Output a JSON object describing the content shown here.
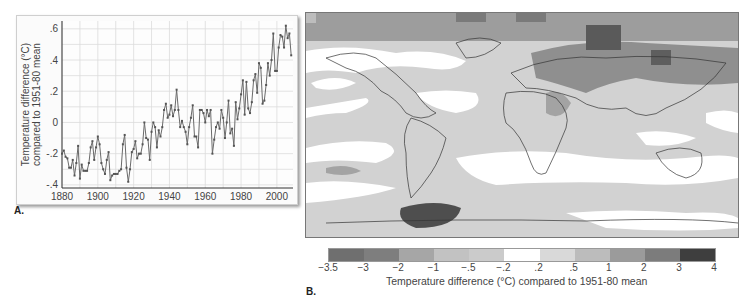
{
  "panels": {
    "a": {
      "letter": "A."
    },
    "b": {
      "letter": "B."
    }
  },
  "chart_data": [
    {
      "type": "line",
      "title": "",
      "xlabel": "",
      "ylabel": "Temperature difference (°C) compared to 1951-80 mean",
      "ylabel_lines": [
        "Temperature difference (°C)",
        "compared to 1951-80 mean"
      ],
      "xlim": [
        1880,
        2009
      ],
      "ylim": [
        -0.4,
        0.65
      ],
      "x_ticks": [
        "1880",
        "1900",
        "1920",
        "1940",
        "1960",
        "1980",
        "2000"
      ],
      "y_ticks": [
        ".6",
        ".4",
        ".2",
        "0",
        "-.2",
        "-.4"
      ],
      "grid": true,
      "marker": "square",
      "series": [
        {
          "name": "Global temperature anomaly",
          "x": [
            1880,
            1881,
            1882,
            1883,
            1884,
            1885,
            1886,
            1887,
            1888,
            1889,
            1890,
            1891,
            1892,
            1893,
            1894,
            1895,
            1896,
            1897,
            1898,
            1899,
            1900,
            1901,
            1902,
            1903,
            1904,
            1905,
            1906,
            1907,
            1908,
            1909,
            1910,
            1911,
            1912,
            1913,
            1914,
            1915,
            1916,
            1917,
            1918,
            1919,
            1920,
            1921,
            1922,
            1923,
            1924,
            1925,
            1926,
            1927,
            1928,
            1929,
            1930,
            1931,
            1932,
            1933,
            1934,
            1935,
            1936,
            1937,
            1938,
            1939,
            1940,
            1941,
            1942,
            1943,
            1944,
            1945,
            1946,
            1947,
            1948,
            1949,
            1950,
            1951,
            1952,
            1953,
            1954,
            1955,
            1956,
            1957,
            1958,
            1959,
            1960,
            1961,
            1962,
            1963,
            1964,
            1965,
            1966,
            1967,
            1968,
            1969,
            1970,
            1971,
            1972,
            1973,
            1974,
            1975,
            1976,
            1977,
            1978,
            1979,
            1980,
            1981,
            1982,
            1983,
            1984,
            1985,
            1986,
            1987,
            1988,
            1989,
            1990,
            1991,
            1992,
            1993,
            1994,
            1995,
            1996,
            1997,
            1998,
            1999,
            2000,
            2001,
            2002,
            2003,
            2004,
            2005,
            2006,
            2007,
            2008
          ],
          "values": [
            -0.2,
            -0.18,
            -0.22,
            -0.23,
            -0.29,
            -0.29,
            -0.24,
            -0.34,
            -0.26,
            -0.15,
            -0.36,
            -0.27,
            -0.31,
            -0.31,
            -0.31,
            -0.26,
            -0.16,
            -0.12,
            -0.24,
            -0.16,
            -0.09,
            -0.14,
            -0.26,
            -0.3,
            -0.33,
            -0.24,
            -0.19,
            -0.37,
            -0.34,
            -0.33,
            -0.33,
            -0.33,
            -0.31,
            -0.3,
            -0.14,
            -0.08,
            -0.29,
            -0.38,
            -0.3,
            -0.19,
            -0.17,
            -0.12,
            -0.23,
            -0.2,
            -0.2,
            -0.14,
            -0.0,
            -0.1,
            -0.11,
            -0.24,
            -0.06,
            -0.0,
            -0.03,
            -0.16,
            -0.05,
            -0.09,
            -0.03,
            0.08,
            0.12,
            0.03,
            0.05,
            0.11,
            0.04,
            0.08,
            0.21,
            0.08,
            -0.03,
            0.01,
            -0.03,
            -0.06,
            -0.14,
            -0.03,
            0.03,
            0.11,
            -0.09,
            -0.09,
            -0.16,
            0.08,
            0.08,
            0.06,
            0.0,
            0.08,
            0.04,
            0.08,
            -0.2,
            -0.11,
            -0.03,
            0.0,
            -0.04,
            0.08,
            0.03,
            -0.1,
            0.0,
            0.14,
            -0.07,
            -0.04,
            -0.15,
            0.13,
            0.02,
            0.09,
            0.18,
            0.27,
            0.05,
            0.26,
            0.09,
            0.06,
            0.13,
            0.27,
            0.31,
            0.19,
            0.38,
            0.35,
            0.12,
            0.14,
            0.24,
            0.38,
            0.3,
            0.4,
            0.57,
            0.33,
            0.33,
            0.48,
            0.56,
            0.55,
            0.48,
            0.62,
            0.54,
            0.57,
            0.43
          ]
        }
      ]
    },
    {
      "type": "heatmap",
      "title": "Global map of temperature difference",
      "colorbar": {
        "label": "Temperature difference (°C) compared to 1951-80 mean",
        "tick_labels": [
          "−3.5",
          "−3",
          "−2",
          "−1",
          "−.5",
          "−.2",
          ".2",
          ".5",
          "1",
          "2",
          "3",
          "4"
        ],
        "bins": [
          [
            -3.5,
            -3
          ],
          [
            -3,
            -2
          ],
          [
            -2,
            -1
          ],
          [
            -1,
            -0.5
          ],
          [
            -0.5,
            -0.2
          ],
          [
            -0.2,
            0.2
          ],
          [
            0.2,
            0.5
          ],
          [
            0.5,
            1
          ],
          [
            1,
            2
          ],
          [
            2,
            3
          ],
          [
            3,
            4
          ]
        ],
        "colors": [
          "#6f6f6f",
          "#7e7e7e",
          "#a6a6a6",
          "#c2c2c2",
          "#cbcbcb",
          "#ffffff",
          "#d9d9d9",
          "#bcbcbc",
          "#9b9b9b",
          "#7c7c7c",
          "#3e3e3e"
        ]
      }
    }
  ]
}
